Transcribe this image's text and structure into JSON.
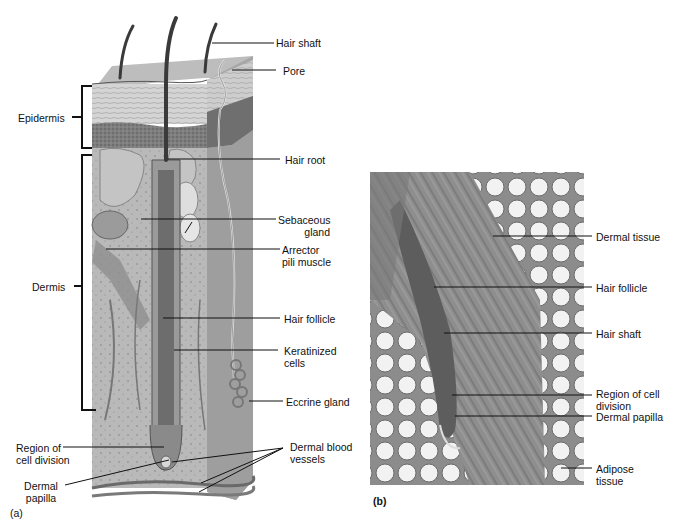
{
  "figure": {
    "panel_a": {
      "tag": "(a)",
      "labels": {
        "hair_shaft": "Hair shaft",
        "pore": "Pore",
        "epidermis": "Epidermis",
        "hair_root": "Hair root",
        "sebaceous_gland_1": "Sebaceous",
        "sebaceous_gland_2": "gland",
        "arrector_1": "Arrector",
        "arrector_2": "pili muscle",
        "dermis": "Dermis",
        "hair_follicle": "Hair follicle",
        "keratinized_1": "Keratinized",
        "keratinized_2": "cells",
        "eccrine_gland": "Eccrine gland",
        "region_cell_division_1": "Region of",
        "region_cell_division_2": "cell division",
        "dermal_papilla_1": "Dermal",
        "dermal_papilla_2": "papilla",
        "dermal_blood_vessels_1": "Dermal blood",
        "dermal_blood_vessels_2": "vessels"
      }
    },
    "panel_b": {
      "tag": "(b)",
      "labels": {
        "dermal_tissue": "Dermal tissue",
        "hair_follicle": "Hair follicle",
        "hair_shaft": "Hair shaft",
        "region_cell_division_1": "Region of cell",
        "region_cell_division_2": "division",
        "dermal_papilla": "Dermal papilla",
        "adipose_1": "Adipose",
        "adipose_2": "tissue"
      }
    },
    "colors": {
      "ink": "#111111",
      "block_light": "#c8c8c8",
      "block_mid": "#a9a9a9",
      "block_dark": "#6e6e6e",
      "micro_bg": "#9a9a9a"
    }
  }
}
